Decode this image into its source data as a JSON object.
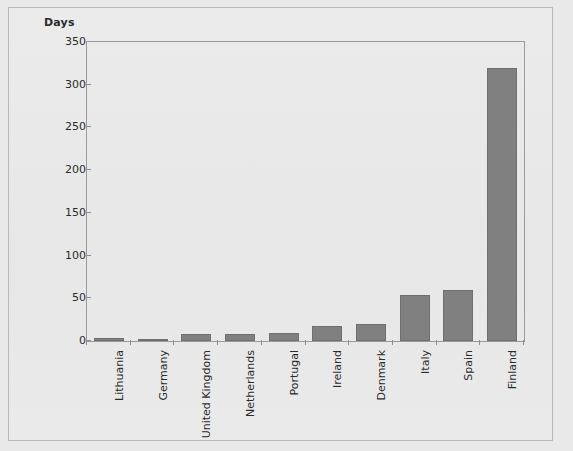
{
  "chart_data": {
    "type": "bar",
    "title": "",
    "xlabel": "",
    "ylabel": "Days",
    "ylim": [
      0,
      350
    ],
    "yticks": [
      0,
      50,
      100,
      150,
      200,
      250,
      300,
      350
    ],
    "grid": false,
    "legend": null,
    "bar_color": "#808080",
    "categories": [
      "Lithuania",
      "Germany",
      "United Kingdom",
      "Netherlands",
      "Portugal",
      "Ireland",
      "Denmark",
      "Italy",
      "Spain",
      "Finland"
    ],
    "values": [
      3,
      2,
      8,
      8,
      9,
      18,
      20,
      54,
      60,
      320
    ]
  },
  "figure": {
    "background_color": "#e9e9e9",
    "frame_color": "#b8b8b8",
    "axis_color": "#9a9a9a"
  }
}
